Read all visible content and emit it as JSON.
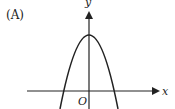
{
  "figure": {
    "option_label": "(A)",
    "x_axis_label": "x",
    "y_axis_label": "y",
    "origin_label": "O",
    "curve": "downward-opening parabola, vertex on positive y-axis, two x-intercepts symmetric about origin",
    "colors": {
      "stroke": "#222222",
      "background": "#ffffff"
    }
  }
}
